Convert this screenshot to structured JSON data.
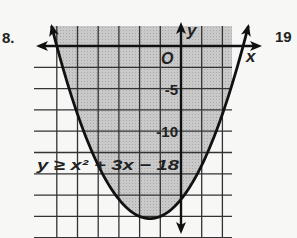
{
  "problem_numbers": {
    "left": "8.",
    "right": "19"
  },
  "chart_data": {
    "type": "line",
    "title": "",
    "inequality": "y ≥ x² + 3x − 18",
    "function": "x^2 + 3x - 18",
    "relation": ">=",
    "shading": "above curve (inside parabola)",
    "boundary_style": "solid",
    "xlabel": "x",
    "ylabel": "y",
    "origin_label": "O",
    "y_tick_labels": [
      "-5",
      "-10"
    ],
    "x_scale_per_grid": 1,
    "y_scale_per_grid": 2.5,
    "xlim": [
      -6.2,
      2.5
    ],
    "ylim": [
      -22,
      2
    ],
    "vertex": [
      -1.5,
      -20.25
    ],
    "x_intercepts": [
      -6,
      3
    ],
    "y_intercept": -18,
    "grid": true,
    "colors": {
      "shade": "#c4c4c4",
      "line": "#1a1a1a",
      "grid": "#333333"
    }
  }
}
